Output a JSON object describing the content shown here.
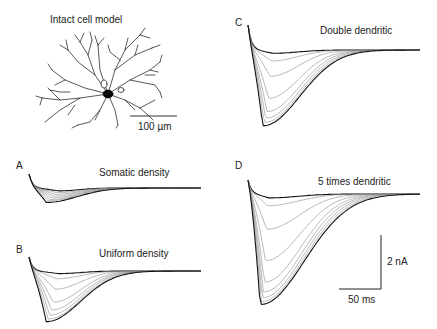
{
  "figure": {
    "cell_panel": {
      "title": "Intact cell model",
      "scale_bar_label": "100 µm"
    },
    "panels": [
      {
        "letter": "A",
        "title": "Somatic density"
      },
      {
        "letter": "B",
        "title": "Uniform density"
      },
      {
        "letter": "C",
        "title": "Double dendritic"
      },
      {
        "letter": "D",
        "title": "5 times dendritic"
      }
    ],
    "scale_bar": {
      "current_label": "2 nA",
      "time_label": "50 ms"
    }
  },
  "chart_data": [
    {
      "type": "line",
      "panel": "A",
      "title": "Somatic density",
      "description": "Family of inward current traces; small peak amplitude (~0.25 nA), near-baseline",
      "n_traces": 8,
      "peak_amplitudes_nA": [
        -0.05,
        -0.08,
        -0.11,
        -0.14,
        -0.17,
        -0.2,
        -0.22,
        -0.25
      ],
      "time_to_peak_ms": 15,
      "duration_ms": 200
    },
    {
      "type": "line",
      "panel": "B",
      "title": "Uniform density",
      "n_traces": 8,
      "peak_amplitudes_nA": [
        -0.1,
        -0.3,
        -0.7,
        -1.2,
        -1.5,
        -1.7,
        -1.85,
        -1.95
      ],
      "time_to_peak_ms": 15,
      "duration_ms": 200
    },
    {
      "type": "line",
      "panel": "C",
      "title": "Double dendritic",
      "n_traces": 8,
      "peak_amplitudes_nA": [
        -0.15,
        -0.5,
        -1.2,
        -2.2,
        -2.8,
        -3.1,
        -3.3,
        -3.45
      ],
      "time_to_peak_ms": 15,
      "duration_ms": 200
    },
    {
      "type": "line",
      "panel": "D",
      "title": "5 times dendritic",
      "n_traces": 9,
      "peak_amplitudes_nA": [
        -0.2,
        -0.6,
        -1.8,
        -3.4,
        -4.5,
        -5.0,
        -5.3,
        -5.5,
        -5.65
      ],
      "time_to_peak_ms": 12,
      "duration_ms": 200
    }
  ]
}
